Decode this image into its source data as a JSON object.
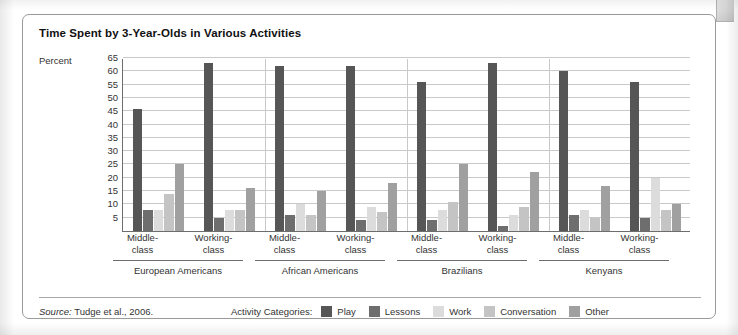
{
  "figure": {
    "title": "Time Spent by 3-Year-Olds in Various Activities",
    "source_prefix": "Source:",
    "source_text": " Tudge et al., 2006.",
    "legend_title": "Activity Categories:"
  },
  "chart_data": {
    "type": "bar",
    "title": "Time Spent by 3-Year-Olds in Various Activities",
    "xlabel": "",
    "ylabel": "Percent",
    "ylim": [
      0,
      65
    ],
    "yticks": [
      5,
      10,
      15,
      20,
      25,
      30,
      35,
      40,
      45,
      50,
      55,
      60,
      65
    ],
    "grid": true,
    "legend_position": "bottom",
    "groups": [
      "European Americans",
      "African Americans",
      "Brazilians",
      "Kenyans"
    ],
    "subgroups": [
      "Middle-class",
      "Working-class"
    ],
    "categories": [
      "European Americans Middle-class",
      "European Americans Working-class",
      "African Americans Middle-class",
      "African Americans Working-class",
      "Brazilians Middle-class",
      "Brazilians Working-class",
      "Kenyans Middle-class",
      "Kenyans Working-class"
    ],
    "series": [
      {
        "name": "Play",
        "color": "#565656",
        "values": [
          46,
          63,
          62,
          62,
          56,
          63,
          60,
          56
        ]
      },
      {
        "name": "Lessons",
        "color": "#6e6e6e",
        "values": [
          8,
          5,
          6,
          4,
          4,
          2,
          6,
          5
        ]
      },
      {
        "name": "Work",
        "color": "#dcdcdc",
        "values": [
          8,
          8,
          10,
          9,
          8,
          6,
          8,
          20
        ]
      },
      {
        "name": "Conversation",
        "color": "#c4c4c4",
        "values": [
          14,
          8,
          6,
          7,
          11,
          9,
          5,
          8
        ]
      },
      {
        "name": "Other",
        "color": "#a0a0a0",
        "values": [
          25,
          16,
          15,
          18,
          25,
          22,
          17,
          10
        ]
      }
    ]
  }
}
